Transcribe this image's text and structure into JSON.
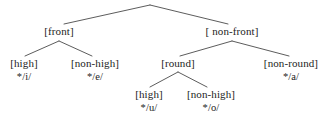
{
  "diagram": {
    "type": "feature-tree",
    "nodes": [
      {
        "id": "root",
        "label": "",
        "phoneme": "",
        "x": 150,
        "y": 4,
        "hidden": true
      },
      {
        "id": "front",
        "label": "[front]",
        "phoneme": "",
        "x": 59,
        "y": 26
      },
      {
        "id": "nonfront",
        "label": "[ non-front]",
        "phoneme": "",
        "x": 232,
        "y": 26
      },
      {
        "id": "high-i",
        "label": "[high]",
        "phoneme": "*/i/",
        "x": 24,
        "y": 58
      },
      {
        "id": "nonhigh-e",
        "label": "[non-high]",
        "phoneme": "*/e/",
        "x": 95,
        "y": 58
      },
      {
        "id": "round",
        "label": "[round]",
        "phoneme": "",
        "x": 178,
        "y": 58
      },
      {
        "id": "nonround-a",
        "label": "[non-round]",
        "phoneme": "*/a/",
        "x": 291,
        "y": 58
      },
      {
        "id": "high-u",
        "label": "[high]",
        "phoneme": "*/u/",
        "x": 149,
        "y": 89
      },
      {
        "id": "nonhigh-o",
        "label": "[non-high]",
        "phoneme": "*/o/",
        "x": 211,
        "y": 89
      }
    ],
    "branches": [
      {
        "from": "root",
        "to": "front",
        "x1": 150,
        "y1": 5,
        "x2": 64,
        "y2": 24
      },
      {
        "from": "root",
        "to": "nonfront",
        "x1": 150,
        "y1": 5,
        "x2": 228,
        "y2": 24
      },
      {
        "from": "front",
        "to": "high-i",
        "x1": 59,
        "y1": 41,
        "x2": 25,
        "y2": 56
      },
      {
        "from": "front",
        "to": "nonhigh-e",
        "x1": 59,
        "y1": 41,
        "x2": 92,
        "y2": 56
      },
      {
        "from": "nonfront",
        "to": "round",
        "x1": 232,
        "y1": 41,
        "x2": 180,
        "y2": 56
      },
      {
        "from": "nonfront",
        "to": "nonround-a",
        "x1": 232,
        "y1": 41,
        "x2": 289,
        "y2": 56
      },
      {
        "from": "round",
        "to": "high-u",
        "x1": 178,
        "y1": 72,
        "x2": 150,
        "y2": 87
      },
      {
        "from": "round",
        "to": "nonhigh-o",
        "x1": 178,
        "y1": 72,
        "x2": 207,
        "y2": 87
      }
    ],
    "colors": {
      "background": "#ffffff",
      "stroke": "#4a4a4a",
      "text": "#1c1c1c"
    }
  }
}
